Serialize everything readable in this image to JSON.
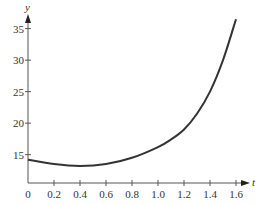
{
  "chart_data": {
    "type": "line",
    "title": "",
    "xlabel": "t",
    "ylabel": "y",
    "xlim": [
      0,
      1.62
    ],
    "ylim": [
      10.5,
      37
    ],
    "x_ticks": [
      0,
      0.2,
      0.4,
      0.6,
      0.8,
      1.0,
      1.2,
      1.4,
      1.6
    ],
    "x_tick_labels": [
      "0",
      "0.2",
      "0.4",
      "0.6",
      "0.8",
      "1.0",
      "1.2",
      "1.4",
      "1.6"
    ],
    "y_ticks": [
      15,
      20,
      25,
      30,
      35
    ],
    "y_tick_labels": [
      "15",
      "20",
      "25",
      "30",
      "35"
    ],
    "grid": false,
    "legend": null,
    "series": [
      {
        "name": "y(t)",
        "color": "#333333",
        "x": [
          0,
          0.2,
          0.4,
          0.6,
          0.8,
          1.0,
          1.1,
          1.2,
          1.3,
          1.4,
          1.5,
          1.6
        ],
        "values": [
          14.2,
          13.5,
          13.2,
          13.5,
          14.5,
          16.2,
          17.4,
          19.0,
          21.5,
          25.0,
          30.0,
          36.5
        ]
      }
    ]
  }
}
